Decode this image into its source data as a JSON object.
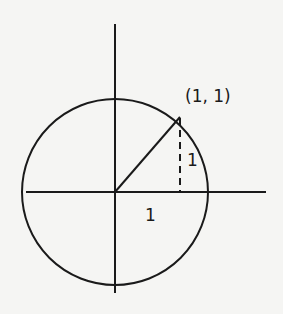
{
  "diagram": {
    "point_label": "(1, 1)",
    "vertical_leg_label": "1",
    "horizontal_leg_label": "1",
    "stroke_color": "#1a1a1a",
    "background_color": "#f5f5f3"
  }
}
